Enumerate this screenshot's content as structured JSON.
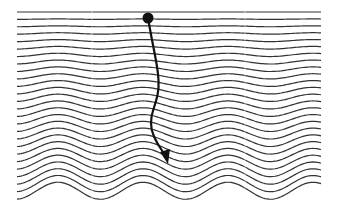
{
  "figure": {
    "width": 338,
    "height": 204,
    "background": "#ffffff",
    "line_color": "#333333",
    "accent_color": "#111111",
    "seam_color": "#ffffff"
  },
  "wave_field": {
    "x_start": 17,
    "x_end": 321,
    "y_top": 12,
    "line_count": 26,
    "line_spacing": 7.15,
    "wavelength": 85,
    "peak_x": 58,
    "amplitude_top": 0,
    "amplitude_bottom": 8.5,
    "stroke_width": 1.2
  },
  "seams": {
    "x_positions": [
      92,
      245
    ]
  },
  "trajectory": {
    "start_marker": {
      "cx": 148,
      "cy": 18,
      "r": 5.5
    },
    "path_points": [
      [
        148,
        18
      ],
      [
        151,
        35
      ],
      [
        155,
        55
      ],
      [
        158,
        72
      ],
      [
        159,
        88
      ],
      [
        156,
        102
      ],
      [
        151,
        116
      ],
      [
        151,
        130
      ],
      [
        157,
        143
      ],
      [
        163,
        152
      ]
    ],
    "arrowhead": {
      "tip": [
        168,
        164
      ],
      "left": [
        160,
        152
      ],
      "right": [
        170,
        149
      ]
    },
    "stroke_width": 2.2
  }
}
